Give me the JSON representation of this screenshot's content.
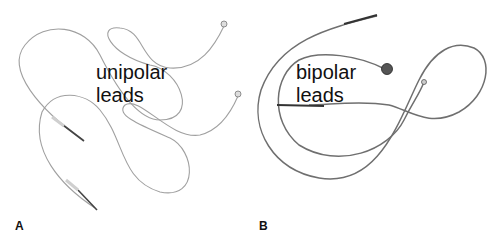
{
  "figure": {
    "panels": [
      {
        "letter": "A",
        "caption_line1": "unipolar",
        "caption_line2": "leads"
      },
      {
        "letter": "B",
        "caption_line1": "bipolar",
        "caption_line2": "leads"
      }
    ],
    "colors": {
      "background": "#ffffff",
      "lead_wire_a": "#9a9a9a",
      "lead_wire_b": "#6f6f6f",
      "text": "#111111"
    }
  }
}
